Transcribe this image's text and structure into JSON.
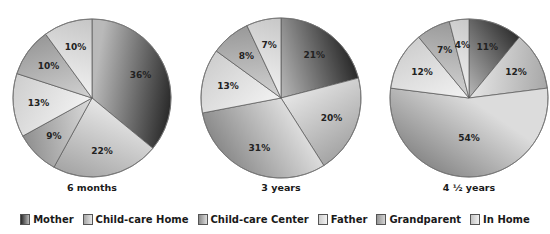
{
  "chart_data": {
    "type": "pie",
    "title": "",
    "categories": [
      "Mother",
      "Child-care Home",
      "Child-care Center",
      "Father",
      "Grandparent",
      "In Home"
    ],
    "series": [
      {
        "name": "6 months",
        "values": [
          36,
          22,
          9,
          13,
          10,
          10
        ]
      },
      {
        "name": "3 years",
        "values": [
          21,
          20,
          31,
          13,
          8,
          7
        ]
      },
      {
        "name": "4 ½ years",
        "values": [
          11,
          12,
          54,
          12,
          7,
          4
        ]
      }
    ],
    "legend_position": "bottom",
    "value_format": "percent"
  },
  "pies": [
    {
      "caption": "6 months",
      "cx": 92,
      "cy": 98,
      "r": 79
    },
    {
      "caption": "3 years",
      "cx": 281,
      "cy": 98,
      "r": 80
    },
    {
      "caption": "4 ½ years",
      "cx": 469,
      "cy": 98,
      "r": 79
    }
  ],
  "legend": {
    "items": [
      {
        "label": "Mother",
        "color_light": "#b9b9b9",
        "color_dark": "#2a2a2a"
      },
      {
        "label": "Child-care Home",
        "color_light": "#e6e6e6",
        "color_dark": "#a5a5a5"
      },
      {
        "label": "Child-care Center",
        "color_light": "#dcdcdc",
        "color_dark": "#8a8a8a"
      },
      {
        "label": "Father",
        "color_light": "#f2f2f2",
        "color_dark": "#cdcdcd"
      },
      {
        "label": "Grandparent",
        "color_light": "#d2d2d2",
        "color_dark": "#959595"
      },
      {
        "label": "In Home",
        "color_light": "#f0f0f0",
        "color_dark": "#c4c4c4"
      }
    ]
  }
}
